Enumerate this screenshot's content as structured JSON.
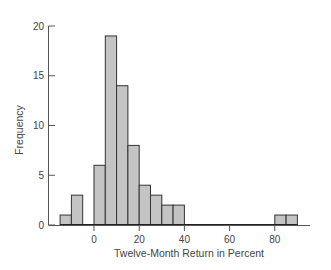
{
  "chart_data": {
    "type": "bar",
    "subtype": "histogram",
    "title": "",
    "xlabel": "Twelve-Month Return in Percent",
    "ylabel": "Frequency",
    "bin_width": 5,
    "bins": [
      {
        "start": -15,
        "end": -10,
        "count": 1
      },
      {
        "start": -10,
        "end": -5,
        "count": 3
      },
      {
        "start": -5,
        "end": 0,
        "count": 0
      },
      {
        "start": 0,
        "end": 5,
        "count": 6
      },
      {
        "start": 5,
        "end": 10,
        "count": 19
      },
      {
        "start": 10,
        "end": 15,
        "count": 14
      },
      {
        "start": 15,
        "end": 20,
        "count": 8
      },
      {
        "start": 20,
        "end": 25,
        "count": 4
      },
      {
        "start": 25,
        "end": 30,
        "count": 3
      },
      {
        "start": 30,
        "end": 35,
        "count": 2
      },
      {
        "start": 35,
        "end": 40,
        "count": 2
      },
      {
        "start": 40,
        "end": 45,
        "count": 0
      },
      {
        "start": 45,
        "end": 50,
        "count": 0
      },
      {
        "start": 50,
        "end": 55,
        "count": 0
      },
      {
        "start": 55,
        "end": 60,
        "count": 0
      },
      {
        "start": 60,
        "end": 65,
        "count": 0
      },
      {
        "start": 65,
        "end": 70,
        "count": 0
      },
      {
        "start": 70,
        "end": 75,
        "count": 0
      },
      {
        "start": 75,
        "end": 80,
        "count": 0
      },
      {
        "start": 80,
        "end": 85,
        "count": 1
      },
      {
        "start": 85,
        "end": 90,
        "count": 1
      }
    ],
    "x_ticks": [
      0,
      20,
      40,
      60,
      80
    ],
    "y_ticks": [
      0,
      5,
      10,
      15,
      20
    ],
    "xlim": [
      -18,
      95
    ],
    "ylim": [
      0,
      20
    ],
    "grid": false,
    "legend": null,
    "bar_fill": "#c4c4c4",
    "bar_stroke": "#333333"
  }
}
